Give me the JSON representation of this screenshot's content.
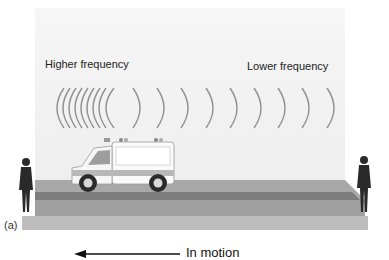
{
  "figure": {
    "panel_label": "(a)",
    "left_label": "Higher frequency",
    "right_label": "Lower frequency",
    "motion_label": "In motion",
    "motion_direction": "left",
    "colors": {
      "sky": "#f0f0f0",
      "wave": "#8a8a8a",
      "road_top": "#a9a9a9",
      "road_stripe": "#7a7a7a",
      "road_front": "#bdbdbd",
      "silhouette": "#2a2a2a"
    },
    "subjects": [
      "ambulance",
      "observer-left",
      "observer-right"
    ]
  }
}
